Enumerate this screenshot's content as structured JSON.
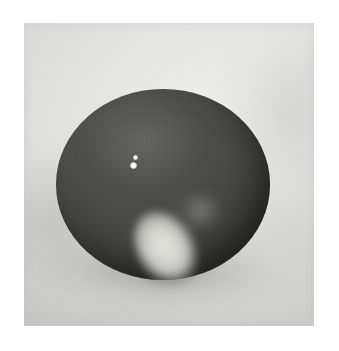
{
  "page": {
    "width_px": 339,
    "height_px": 351,
    "background_color": "#ffffff",
    "content_type": "photograph",
    "color_mode": "grayscale"
  },
  "photo": {
    "name": "dark-sphere-photograph",
    "left_px": 24,
    "top_px": 23,
    "width_px": 290,
    "height_px": 303,
    "backdrop_color": "#d8d8d6",
    "backdrop_description": "flat light gray studio surface with soft vignetting, slightly darker toward the lower-left and the outer corners",
    "grain": "visible film grain across the entire print"
  },
  "subject": {
    "name": "dark-sphere",
    "description": "a large matte dark gray sphere resting on a light gray surface, photographed head-on",
    "fill_color": "#484846",
    "shadow_color": "#333331",
    "center_x_px": 163,
    "center_y_px": 185,
    "width_px": 214,
    "height_px": 191,
    "radius_px": 107
  },
  "highlights": {
    "main": {
      "name": "main-specular-highlight",
      "description": "bright tilted elliptical highlight on the lower-center of the sphere",
      "center_x_px": 168,
      "center_y_px": 250,
      "width_px": 64,
      "height_px": 86,
      "rotation_deg": -32,
      "color": "#ddddd8"
    },
    "halo_right": {
      "name": "secondary-halo-right",
      "description": "faint soft light patch above and right of the main highlight",
      "center_x_px": 200,
      "center_y_px": 211,
      "color": "#b0b0ab"
    },
    "halo_left": {
      "name": "secondary-halo-left",
      "description": "faint soft light patch left of the main highlight",
      "center_x_px": 148,
      "center_y_px": 231,
      "color": "#9e9e9a"
    },
    "shade_below": {
      "name": "highlight-shade-crescent",
      "description": "dark crescent shadow hugging the lower edge of the bright highlight",
      "color": "#1e1e1c"
    },
    "specular_points": [
      {
        "name": "specular-point-upper",
        "center_x_px": 136,
        "center_y_px": 157,
        "diameter_px": 5,
        "color": "#ffffff"
      },
      {
        "name": "specular-point-lower",
        "center_x_px": 134,
        "center_y_px": 165,
        "diameter_px": 7,
        "color": "#ffffff"
      }
    ]
  },
  "cast_shadow": {
    "name": "contact-shadow",
    "description": "soft shadow pooled on the surface beneath and to the left of the sphere",
    "color": "#59595 7",
    "center_x_px": 161,
    "center_y_px": 276
  }
}
